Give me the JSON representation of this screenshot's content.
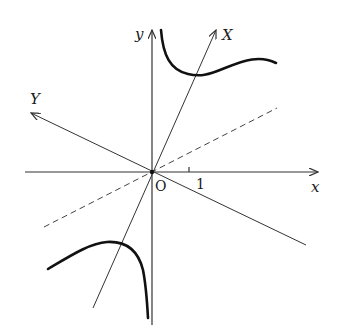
{
  "diagram": {
    "type": "coordinate-plot-hyperbola-rotated-axes",
    "labels": {
      "x_axis": "x",
      "y_axis": "y",
      "X_axis": "X",
      "Y_axis": "Y",
      "origin": "O",
      "tick_x": "1"
    },
    "elements": [
      {
        "name": "x-axis",
        "description": "horizontal axis with arrow to the right"
      },
      {
        "name": "y-axis",
        "description": "vertical axis with arrow upward"
      },
      {
        "name": "X-axis",
        "description": "rotated axis through origin with arrow to upper right"
      },
      {
        "name": "Y-axis",
        "description": "rotated axis perpendicular-ish, arrow to upper left"
      },
      {
        "name": "asymptote",
        "description": "dashed line through origin, slope about 1/2"
      },
      {
        "name": "hyperbola-upper-branch",
        "description": "curve in first quadrant, asymptotic to y-axis and dashed line"
      },
      {
        "name": "hyperbola-lower-branch",
        "description": "curve in third quadrant, asymptotic to y-axis and dashed line"
      }
    ],
    "colors": {
      "stroke": "#333333",
      "curve": "#111111",
      "background": "#ffffff"
    }
  }
}
